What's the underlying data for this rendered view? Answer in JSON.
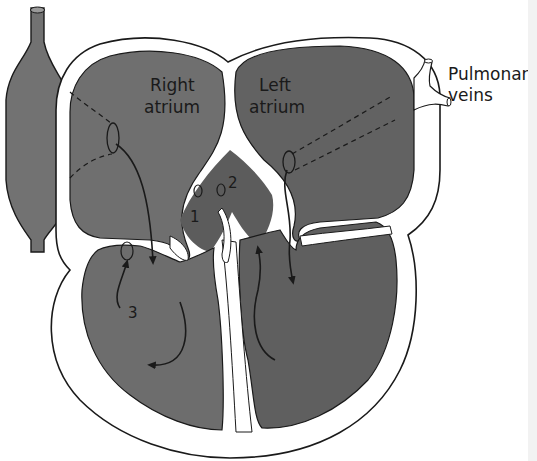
{
  "diagram": {
    "colors": {
      "background": "#ffffff",
      "chamber_fill_light": "#6f6f6f",
      "chamber_fill_dark": "#5f5f5f",
      "vessel_fill": "#727272",
      "outline": "#1a1a1a",
      "wall": "#ffffff"
    },
    "labels": {
      "right_atrium_line1": "Right",
      "right_atrium_line2": "atrium",
      "left_atrium_line1": "Left",
      "left_atrium_line2": "atrium",
      "pulmonary_line1": "Pulmonar",
      "pulmonary_line2": "veins",
      "marker_1": "1",
      "marker_2": "2",
      "marker_3": "3"
    }
  }
}
